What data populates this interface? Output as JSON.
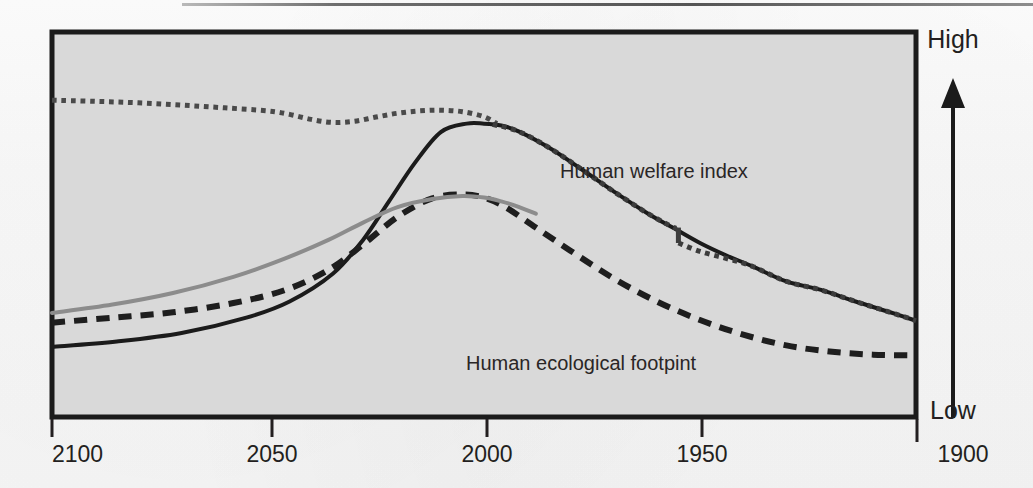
{
  "figure": {
    "plot_background": "#d9d9d9",
    "frame_color": "#1b1b1b",
    "paper_color": "#fdfdfd"
  },
  "axis": {
    "x_ticks": [
      "2100",
      "2050",
      "2000",
      "1950",
      "1900"
    ],
    "y_high_label": "High",
    "y_low_label": "Low",
    "y_arrow_icon": "up-arrow-icon"
  },
  "labels": {
    "welfare": "Human welfare index",
    "footprint": "Human ecological footpint"
  },
  "chart_data": {
    "type": "line",
    "title": "",
    "xlabel": "",
    "ylabel": "",
    "x_axis_reversed": true,
    "x_tick_values": [
      2100,
      2050,
      2000,
      1950,
      1900
    ],
    "xlim": [
      2100,
      1900
    ],
    "ylim_labels": [
      "Low",
      "High"
    ],
    "grid": false,
    "legend": "inline-annotations",
    "annotations": [
      {
        "text": "Human welfare index",
        "x": 1985,
        "y_rel": 0.66
      },
      {
        "text": "Human ecological footpint",
        "x": 1958,
        "y_rel": 0.16
      }
    ],
    "series": [
      {
        "name": "Human welfare index (scenario, dotted upper)",
        "style": "dotted",
        "color": "#4a4a4a",
        "width": 5,
        "x": [
          2100,
          2090,
          2080,
          2070,
          2060,
          2050,
          2045,
          2040,
          2035,
          2030,
          2025,
          2020,
          2015,
          2010,
          2005,
          2000,
          1997
        ],
        "y_rel": [
          0.823,
          0.82,
          0.816,
          0.81,
          0.803,
          0.795,
          0.786,
          0.773,
          0.765,
          0.768,
          0.779,
          0.789,
          0.795,
          0.797,
          0.793,
          0.78,
          0.762
        ]
      },
      {
        "name": "Human welfare index (historical, solid black)",
        "style": "solid",
        "color": "#1b1b1b",
        "width": 4,
        "x": [
          2100,
          2085,
          2070,
          2055,
          2045,
          2035,
          2028,
          2022,
          2016,
          2010,
          2004,
          2000,
          1996,
          1992,
          1985,
          1978,
          1970,
          1962,
          1956,
          1950,
          1944,
          1938,
          1930,
          1922,
          1914,
          1906,
          1900
        ],
        "y_rel": [
          0.182,
          0.196,
          0.218,
          0.258,
          0.3,
          0.372,
          0.46,
          0.56,
          0.66,
          0.74,
          0.762,
          0.762,
          0.757,
          0.742,
          0.7,
          0.648,
          0.586,
          0.528,
          0.49,
          0.452,
          0.42,
          0.392,
          0.352,
          0.33,
          0.3,
          0.272,
          0.25
        ]
      },
      {
        "name": "Human welfare index (overlay dotted tail)",
        "style": "dotted",
        "color": "#3c3c3c",
        "width": 5,
        "x": [
          1998,
          1992,
          1985,
          1978,
          1970,
          1962,
          1956,
          1955,
          1950,
          1944,
          1938,
          1930,
          1922,
          1914,
          1906,
          1900
        ],
        "y_rel": [
          0.76,
          0.742,
          0.7,
          0.648,
          0.586,
          0.528,
          0.492,
          0.452,
          0.43,
          0.412,
          0.392,
          0.352,
          0.33,
          0.3,
          0.272,
          0.25
        ],
        "step_discontinuity": {
          "x": 1955,
          "from_y_rel": 0.492,
          "to_y_rel": 0.452
        }
      },
      {
        "name": "Human ecological footpint (dashed)",
        "style": "dashed",
        "color": "#1e1e1e",
        "width": 6,
        "x": [
          2100,
          2086,
          2072,
          2058,
          2046,
          2036,
          2028,
          2020,
          2012,
          2005,
          2000,
          1995,
          1988,
          1980,
          1970,
          1960,
          1950,
          1940,
          1930,
          1920,
          1910,
          1900
        ],
        "y_rel": [
          0.245,
          0.258,
          0.272,
          0.296,
          0.33,
          0.382,
          0.448,
          0.52,
          0.568,
          0.578,
          0.57,
          0.545,
          0.492,
          0.432,
          0.36,
          0.3,
          0.252,
          0.214,
          0.186,
          0.17,
          0.162,
          0.16
        ]
      },
      {
        "name": "Projection (grey solid)",
        "style": "solid",
        "color": "#8c8c8c",
        "width": 4,
        "x": [
          2100,
          2086,
          2072,
          2058,
          2046,
          2036,
          2028,
          2020,
          2012,
          2005,
          2000,
          1996,
          1992,
          1988
        ],
        "y_rel": [
          0.27,
          0.292,
          0.322,
          0.364,
          0.412,
          0.46,
          0.505,
          0.545,
          0.566,
          0.574,
          0.57,
          0.56,
          0.546,
          0.528
        ]
      }
    ]
  }
}
